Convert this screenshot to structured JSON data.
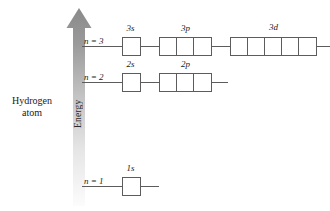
{
  "figure": {
    "caption_line1": "Hydrogen",
    "caption_line2": "atom",
    "axis_label": "Energy",
    "axis_direction": "up",
    "arrow_color_top": "#8f8f8f",
    "arrow_color_bottom": "#fbfbfb",
    "line_color": "#5c5c5c"
  },
  "levels": [
    {
      "n_label": "n = 3",
      "subshells": [
        {
          "label": "3s",
          "boxes": 1
        },
        {
          "label": "3p",
          "boxes": 3
        },
        {
          "label": "3d",
          "boxes": 5
        }
      ]
    },
    {
      "n_label": "n = 2",
      "subshells": [
        {
          "label": "2s",
          "boxes": 1
        },
        {
          "label": "2p",
          "boxes": 3
        }
      ]
    },
    {
      "n_label": "n = 1",
      "subshells": [
        {
          "label": "1s",
          "boxes": 1
        }
      ]
    }
  ]
}
